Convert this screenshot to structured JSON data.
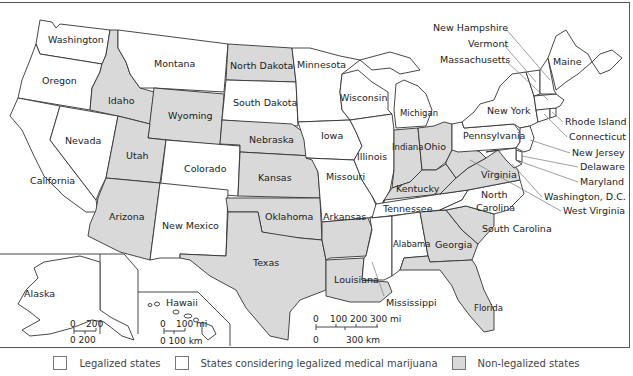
{
  "colors": {
    "legalized": "#ffffff",
    "considering": "#ffffff",
    "non_legalized": "#d9d9d9",
    "border": "#333333",
    "leader": "#777777"
  },
  "states": [
    {
      "id": "washington",
      "label": "Washington",
      "status": "legalized"
    },
    {
      "id": "oregon",
      "label": "Oregon",
      "status": "legalized"
    },
    {
      "id": "california",
      "label": "California",
      "status": "legalized"
    },
    {
      "id": "nevada",
      "label": "Nevada",
      "status": "legalized"
    },
    {
      "id": "idaho",
      "label": "Idaho",
      "status": "non_legalized"
    },
    {
      "id": "montana",
      "label": "Montana",
      "status": "legalized"
    },
    {
      "id": "wyoming",
      "label": "Wyoming",
      "status": "non_legalized"
    },
    {
      "id": "utah",
      "label": "Utah",
      "status": "non_legalized"
    },
    {
      "id": "colorado",
      "label": "Colorado",
      "status": "legalized"
    },
    {
      "id": "arizona",
      "label": "Arizona",
      "status": "non_legalized"
    },
    {
      "id": "new_mexico",
      "label": "New Mexico",
      "status": "legalized"
    },
    {
      "id": "north_dakota",
      "label": "North Dakota",
      "status": "non_legalized"
    },
    {
      "id": "south_dakota",
      "label": "South Dakota",
      "status": "legalized"
    },
    {
      "id": "nebraska",
      "label": "Nebraska",
      "status": "non_legalized"
    },
    {
      "id": "kansas",
      "label": "Kansas",
      "status": "non_legalized"
    },
    {
      "id": "oklahoma",
      "label": "Oklahoma",
      "status": "non_legalized"
    },
    {
      "id": "texas",
      "label": "Texas",
      "status": "non_legalized"
    },
    {
      "id": "minnesota",
      "label": "Minnesota",
      "status": "legalized"
    },
    {
      "id": "iowa",
      "label": "Iowa",
      "status": "legalized"
    },
    {
      "id": "missouri",
      "label": "Missouri",
      "status": "legalized"
    },
    {
      "id": "arkansas",
      "label": "Arkansas",
      "status": "non_legalized"
    },
    {
      "id": "louisiana",
      "label": "Louisiana",
      "status": "non_legalized"
    },
    {
      "id": "wisconsin",
      "label": "Wisconsin",
      "status": "legalized"
    },
    {
      "id": "illinois",
      "label": "Illinois",
      "status": "legalized"
    },
    {
      "id": "michigan",
      "label": "Michigan",
      "status": "legalized"
    },
    {
      "id": "indiana",
      "label": "Indiana",
      "status": "non_legalized"
    },
    {
      "id": "ohio",
      "label": "Ohio",
      "status": "non_legalized"
    },
    {
      "id": "kentucky",
      "label": "Kentucky",
      "status": "non_legalized"
    },
    {
      "id": "tennessee",
      "label": "Tennessee",
      "status": "legalized"
    },
    {
      "id": "mississippi",
      "label": "Mississippi",
      "status": "legalized"
    },
    {
      "id": "alabama",
      "label": "Alabama",
      "status": "legalized"
    },
    {
      "id": "georgia",
      "label": "Georgia",
      "status": "non_legalized"
    },
    {
      "id": "florida",
      "label": "Florida",
      "status": "non_legalized"
    },
    {
      "id": "south_carolina",
      "label": "South Carolina",
      "status": "non_legalized"
    },
    {
      "id": "north_carolina",
      "label": "North Carolina",
      "status": "legalized"
    },
    {
      "id": "virginia",
      "label": "Virginia",
      "status": "non_legalized"
    },
    {
      "id": "west_virginia",
      "label": "West Virginia",
      "status": "non_legalized"
    },
    {
      "id": "pennsylvania",
      "label": "Pennsylvania",
      "status": "legalized"
    },
    {
      "id": "new_york",
      "label": "New York",
      "status": "legalized"
    },
    {
      "id": "new_jersey",
      "label": "New Jersey",
      "status": "legalized"
    },
    {
      "id": "delaware",
      "label": "Delaware",
      "status": "legalized"
    },
    {
      "id": "maryland",
      "label": "Maryland",
      "status": "legalized"
    },
    {
      "id": "washington_dc",
      "label": "Washington, D.C.",
      "status": "legalized"
    },
    {
      "id": "connecticut",
      "label": "Connecticut",
      "status": "legalized"
    },
    {
      "id": "rhode_island",
      "label": "Rhode Island",
      "status": "legalized"
    },
    {
      "id": "massachusetts",
      "label": "Massachusetts",
      "status": "legalized"
    },
    {
      "id": "vermont",
      "label": "Vermont",
      "status": "legalized"
    },
    {
      "id": "new_hampshire",
      "label": "New Hampshire",
      "status": "legalized"
    },
    {
      "id": "maine",
      "label": "Maine",
      "status": "legalized"
    },
    {
      "id": "alaska",
      "label": "Alaska",
      "status": "legalized"
    },
    {
      "id": "hawaii",
      "label": "Hawaii",
      "status": "legalized"
    }
  ],
  "labels": {
    "washington": "Washington",
    "oregon": "Oregon",
    "california": "California",
    "nevada": "Nevada",
    "idaho": "Idaho",
    "montana": "Montana",
    "wyoming": "Wyoming",
    "utah": "Utah",
    "colorado": "Colorado",
    "arizona": "Arizona",
    "new_mexico": "New Mexico",
    "north_dakota": "North Dakota",
    "south_dakota": "South Dakota",
    "nebraska": "Nebraska",
    "kansas": "Kansas",
    "oklahoma": "Oklahoma",
    "texas": "Texas",
    "minnesota": "Minnesota",
    "iowa": "Iowa",
    "missouri": "Missouri",
    "arkansas": "Arkansas",
    "louisiana": "Louisiana",
    "wisconsin": "Wisconsin",
    "illinois": "Illinois",
    "michigan": "Michigan",
    "indiana": "Indiana",
    "ohio": "Ohio",
    "kentucky": "Kentucky",
    "tennessee": "Tennessee",
    "mississippi": "Mississippi",
    "alabama": "Alabama",
    "georgia": "Georgia",
    "florida": "Florida",
    "south_carolina": "South Carolina",
    "north_carolina_1": "North",
    "north_carolina_2": "Carolina",
    "virginia": "Virginia",
    "west_virginia": "West Virginia",
    "pennsylvania": "Pennsylvania",
    "new_york": "New York",
    "new_jersey": "New Jersey",
    "delaware": "Delaware",
    "maryland": "Maryland",
    "washington_dc": "Washington, D.C.",
    "connecticut": "Connecticut",
    "rhode_island": "Rhode Island",
    "massachusetts": "Massachusetts",
    "vermont": "Vermont",
    "new_hampshire": "New Hampshire",
    "maine": "Maine",
    "alaska": "Alaska",
    "hawaii": "Hawaii"
  },
  "scales": {
    "mainland": {
      "mi_labels": [
        "0",
        "100",
        "200",
        "300 mi"
      ],
      "km_labels": [
        "0",
        "300 km"
      ]
    },
    "alaska": {
      "mi_labels": [
        "0",
        "200"
      ],
      "km_labels": [
        "0 200"
      ]
    },
    "hawaii": {
      "mi_labels": [
        "0",
        "100 mi"
      ],
      "km_labels": [
        "0 100 km"
      ]
    }
  },
  "legend": {
    "items": [
      {
        "label": "Legalized states",
        "color": "#ffffff"
      },
      {
        "label": "States considering legalized medical marijuana",
        "color": "#ffffff"
      },
      {
        "label": "Non-legalized states",
        "color": "#d9d9d9"
      }
    ]
  }
}
